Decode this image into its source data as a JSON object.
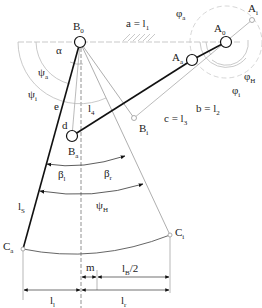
{
  "diagram": {
    "type": "mechanism-kinematic-sketch",
    "points": {
      "B0": {
        "label": "B",
        "sub": "0",
        "x": 80,
        "y": 42
      },
      "A0": {
        "label": "A",
        "sub": "0",
        "x": 226,
        "y": 42
      },
      "Ai": {
        "label": "A",
        "sub": "i",
        "x": 252,
        "y": 20
      },
      "Aa": {
        "label": "A",
        "sub": "a",
        "x": 192,
        "y": 60
      },
      "Ba": {
        "label": "B",
        "sub": "a",
        "x": 72,
        "y": 136
      },
      "Bi": {
        "label": "B",
        "sub": "i",
        "x": 134,
        "y": 118
      },
      "Ca": {
        "label": "C",
        "sub": "a",
        "x": 23,
        "y": 249
      },
      "Ci": {
        "label": "C",
        "sub": "i",
        "x": 170,
        "y": 235
      }
    },
    "labels": {
      "ground": {
        "text": "a = l",
        "sub": "1"
      },
      "crank": {
        "text": "b = l",
        "sub": "2"
      },
      "coupler": {
        "text": "c = l",
        "sub": "3"
      },
      "rocker": {
        "text": "l",
        "sub": "4"
      },
      "alpha": "α",
      "psi_a": {
        "text": "ψ",
        "sub": "a"
      },
      "psi_i": {
        "text": "ψ",
        "sub": "i"
      },
      "psi_H": {
        "text": "ψ",
        "sub": "H"
      },
      "phi_a": {
        "text": "φ",
        "sub": "a"
      },
      "phi_i": {
        "text": "φ",
        "sub": "i"
      },
      "phi_H": {
        "text": "φ",
        "sub": "H"
      },
      "e": "e",
      "d": "d",
      "beta_l": {
        "text": "β",
        "sub": "l"
      },
      "beta_r": {
        "text": "β",
        "sub": "r"
      },
      "l_S": {
        "text": "l",
        "sub": "S"
      },
      "m": "m",
      "l_B_half": {
        "text": "l",
        "sub": "B",
        "suffix": "/2"
      },
      "l_l": {
        "text": "l",
        "sub": "l"
      },
      "l_r": {
        "text": "l",
        "sub": "r"
      }
    },
    "colors": {
      "stroke_main": "#111111",
      "stroke_thin": "#888888",
      "stroke_faint": "#bbbbbb",
      "background": "#ffffff"
    }
  }
}
